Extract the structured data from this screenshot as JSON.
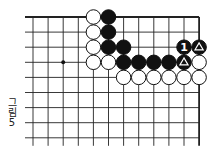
{
  "figure": {
    "caption_line1": "그",
    "caption_line2": "림",
    "caption_line3": "5",
    "caption_full": "그림 5"
  },
  "board": {
    "origin_x": 33,
    "origin_y": 17,
    "spacing": 15.1,
    "cols": 12,
    "rows": 9,
    "line_extend_left": 8,
    "line_extend_bottom": 8,
    "edges": {
      "top": true,
      "right": true,
      "left": false,
      "bottom": false
    },
    "line_color": "#222222",
    "star_points": [
      {
        "col": 2,
        "row": 3
      }
    ]
  },
  "stones": [
    {
      "col": 4,
      "row": 0,
      "color": "white"
    },
    {
      "col": 5,
      "row": 0,
      "color": "black"
    },
    {
      "col": 4,
      "row": 1,
      "color": "white"
    },
    {
      "col": 5,
      "row": 1,
      "color": "black"
    },
    {
      "col": 4,
      "row": 2,
      "color": "white"
    },
    {
      "col": 5,
      "row": 2,
      "color": "black"
    },
    {
      "col": 6,
      "row": 2,
      "color": "black"
    },
    {
      "col": 10,
      "row": 2,
      "color": "black",
      "label": "1"
    },
    {
      "col": 11,
      "row": 2,
      "color": "black",
      "mark": "triangle"
    },
    {
      "col": 4,
      "row": 3,
      "color": "white"
    },
    {
      "col": 5,
      "row": 3,
      "color": "white"
    },
    {
      "col": 6,
      "row": 3,
      "color": "black"
    },
    {
      "col": 7,
      "row": 3,
      "color": "black"
    },
    {
      "col": 8,
      "row": 3,
      "color": "black"
    },
    {
      "col": 9,
      "row": 3,
      "color": "black"
    },
    {
      "col": 10,
      "row": 3,
      "color": "black",
      "mark": "triangle"
    },
    {
      "col": 11,
      "row": 3,
      "color": "white"
    },
    {
      "col": 6,
      "row": 4,
      "color": "white"
    },
    {
      "col": 7,
      "row": 4,
      "color": "white"
    },
    {
      "col": 8,
      "row": 4,
      "color": "white"
    },
    {
      "col": 9,
      "row": 4,
      "color": "white"
    },
    {
      "col": 10,
      "row": 4,
      "color": "white"
    },
    {
      "col": 11,
      "row": 4,
      "color": "white"
    }
  ]
}
